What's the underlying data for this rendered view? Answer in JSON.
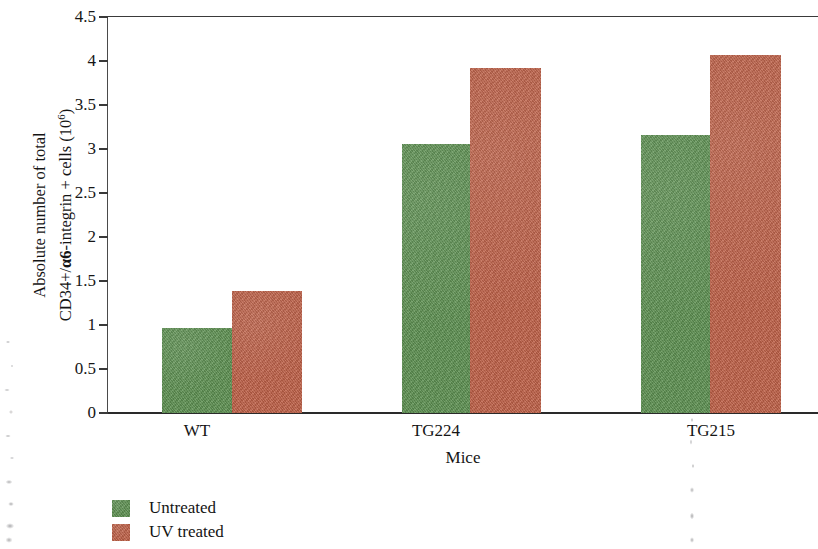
{
  "chart_data": {
    "type": "bar",
    "title": "",
    "xlabel": "Mice",
    "ylabel_line1": "Absolute number of total",
    "ylabel_line2_pre": "CD34+/",
    "ylabel_line2_alpha": "α6",
    "ylabel_line2_mid": "-integrin + cells (10",
    "ylabel_line2_sup": "6",
    "ylabel_line2_post": ")",
    "categories": [
      "WT",
      "TG224",
      "TG215"
    ],
    "series": [
      {
        "name": "Untreated",
        "color": "#5e9152",
        "values": [
          0.97,
          3.08,
          3.18
        ]
      },
      {
        "name": "UV treated",
        "color": "#bf6148",
        "values": [
          1.4,
          3.95,
          4.08
        ]
      }
    ],
    "ylim": [
      0,
      4.5
    ],
    "ytick_values": [
      0,
      0.5,
      1,
      1.5,
      2,
      2.5,
      3,
      3.5,
      4,
      4.5
    ],
    "ytick_labels": [
      "0",
      "0.5",
      "1",
      "1.5",
      "2",
      "2.5",
      "3",
      "3.5",
      "4",
      "4.5"
    ],
    "grid": false,
    "legend_position": "bottom-left",
    "legend_entries": [
      {
        "label": "Untreated",
        "color": "#5e9152"
      },
      {
        "label": "UV treated",
        "color": "#bf6148"
      }
    ]
  },
  "geometry": {
    "plot_left": 108,
    "plot_right": 818,
    "plot_top": 17,
    "plot_bottom": 413,
    "bar_pixels": [
      {
        "series": 0,
        "cat": 0,
        "x": 54,
        "w": 70,
        "top": 311
      },
      {
        "series": 1,
        "cat": 0,
        "x": 124,
        "w": 70,
        "top": 274
      },
      {
        "series": 0,
        "cat": 1,
        "x": 294,
        "w": 68,
        "top": 127
      },
      {
        "series": 1,
        "cat": 1,
        "x": 362,
        "w": 71,
        "top": 51
      },
      {
        "series": 0,
        "cat": 2,
        "x": 533,
        "w": 69,
        "top": 118
      },
      {
        "series": 1,
        "cat": 2,
        "x": 602,
        "w": 71,
        "top": 38
      }
    ],
    "category_label_centers": [
      197,
      436,
      711
    ]
  }
}
